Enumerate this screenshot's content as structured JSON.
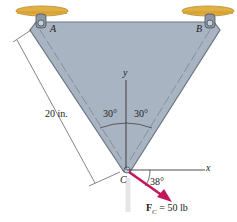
{
  "diagram": {
    "type": "statics-free-body",
    "points": {
      "A": "A",
      "B": "B",
      "C": "C"
    },
    "axes": {
      "x": "x",
      "y": "y"
    },
    "dimension": {
      "length_label": "20 in."
    },
    "angles": {
      "left": "30°",
      "right": "30°",
      "force_angle": "38°"
    },
    "force": {
      "symbol": "F",
      "subscript": "C",
      "equals": " = 50 lb",
      "color": "#c2185b"
    },
    "colors": {
      "plate": "#a9b4c2",
      "plate_edge": "#6a7482",
      "support": "#e0b040",
      "force": "#c2185b"
    }
  }
}
